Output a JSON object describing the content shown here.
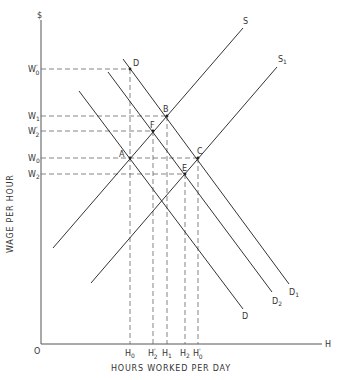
{
  "chart_data": {
    "type": "line",
    "title": "",
    "xlabel": "HOURS WORKED PER DAY",
    "ylabel": "WAGE PER HOUR",
    "y_axis_symbol": "$",
    "x_axis_symbol": "H",
    "origin_label": "O",
    "grid": false,
    "y_ticks": [
      {
        "label": "W",
        "sub": "0",
        "prime": true,
        "y": 69
      },
      {
        "label": "W",
        "sub": "1",
        "prime": false,
        "y": 116
      },
      {
        "label": "W",
        "sub": "2",
        "prime": true,
        "y": 131
      },
      {
        "label": "W",
        "sub": "0",
        "prime": false,
        "y": 158
      },
      {
        "label": "W",
        "sub": "2",
        "prime": false,
        "y": 174
      }
    ],
    "x_ticks": [
      {
        "label": "H",
        "sub": "0",
        "prime": false,
        "x": 130
      },
      {
        "label": "H",
        "sub": "2",
        "prime": true,
        "x": 153
      },
      {
        "label": "H",
        "sub": "1",
        "prime": false,
        "x": 167
      },
      {
        "label": "H",
        "sub": "2",
        "prime": false,
        "x": 185
      },
      {
        "label": "H",
        "sub": "0",
        "prime": true,
        "x": 198
      }
    ],
    "series": [
      {
        "name": "S",
        "kind": "supply",
        "label": "S",
        "sub": "",
        "x1": 53,
        "y1": 248,
        "x2": 243,
        "y2": 28,
        "lx": 243,
        "ly": 24
      },
      {
        "name": "S1",
        "kind": "supply",
        "label": "S",
        "sub": "1",
        "x1": 91,
        "y1": 283,
        "x2": 277,
        "y2": 67,
        "lx": 278,
        "ly": 62
      },
      {
        "name": "D1",
        "kind": "demand",
        "label": "D",
        "sub": "1",
        "x1": 123,
        "y1": 59,
        "x2": 289,
        "y2": 284,
        "lx": 289,
        "ly": 295
      },
      {
        "name": "D2",
        "kind": "demand",
        "label": "D",
        "sub": "2",
        "x1": 108,
        "y1": 72,
        "x2": 272,
        "y2": 292,
        "lx": 272,
        "ly": 304
      },
      {
        "name": "D",
        "kind": "demand",
        "label": "D",
        "sub": "",
        "x1": 79,
        "y1": 91,
        "x2": 243,
        "y2": 309,
        "lx": 242,
        "ly": 319
      }
    ],
    "points": [
      {
        "label": "D",
        "x": 130,
        "y": 69,
        "lx": 133,
        "ly": 66
      },
      {
        "label": "B",
        "x": 167,
        "y": 116,
        "lx": 163,
        "ly": 112
      },
      {
        "label": "F",
        "x": 153,
        "y": 131,
        "lx": 150,
        "ly": 128
      },
      {
        "label": "A",
        "x": 130,
        "y": 158,
        "lx": 119,
        "ly": 157
      },
      {
        "label": "C",
        "x": 198,
        "y": 158,
        "lx": 197,
        "ly": 154
      },
      {
        "label": "E",
        "x": 185,
        "y": 174,
        "lx": 182,
        "ly": 171
      }
    ],
    "axes": {
      "origin_x": 41,
      "origin_y": 344,
      "y_top": 20,
      "x_right": 322
    }
  }
}
